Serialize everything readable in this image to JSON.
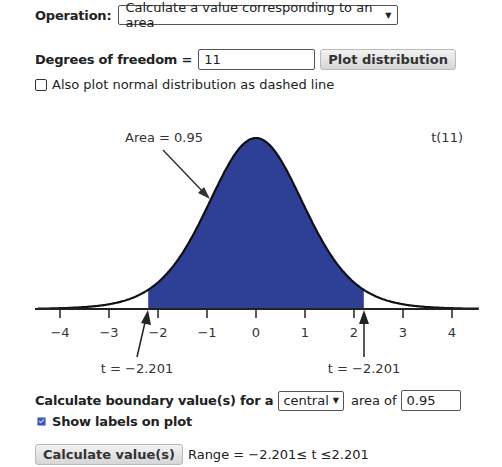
{
  "operation": {
    "label": "Operation:",
    "selected": "Calculate a value corresponding to an area"
  },
  "dof": {
    "label": "Degrees of freedom =",
    "value": "11",
    "plot_button": "Plot distribution"
  },
  "normal_overlay": {
    "label": "Also plot normal distribution as dashed line",
    "checked": false
  },
  "plot": {
    "title": "t(11)",
    "area_label": "Area = 0.95",
    "left_label": "t = −2.201",
    "right_label": "t = −2.201",
    "fill_color": "#2E3F96",
    "line_color": "#111111"
  },
  "calc": {
    "prefix": "Calculate boundary value(s) for a",
    "region_selected": "central",
    "area_of_label": "area of",
    "area_value": "0.95",
    "show_labels": "Show labels on plot",
    "show_labels_checked": true,
    "button": "Calculate value(s)",
    "result": "Range = −2.201≤ t ≤2.201"
  },
  "chart_data": {
    "type": "area",
    "title": "t(11)",
    "distribution": "Student t",
    "degrees_of_freedom": 11,
    "x_ticks": [
      -4,
      -3,
      -2,
      -1,
      0,
      1,
      2,
      3,
      4
    ],
    "x_tick_labels": [
      "−4",
      "−3",
      "−2",
      "−1",
      "0",
      "1",
      "2",
      "3",
      "4"
    ],
    "xlim": [
      -4.5,
      4.6
    ],
    "shaded_region": {
      "from": -2.201,
      "to": 2.201,
      "area": 0.95
    },
    "annotations": [
      {
        "text": "Area = 0.95",
        "points_to": "curve at x≈-1.0"
      },
      {
        "text": "t = −2.201",
        "points_to": -2.201
      },
      {
        "text": "t = −2.201",
        "points_to": 2.201
      }
    ],
    "grid": false,
    "legend": "none"
  }
}
